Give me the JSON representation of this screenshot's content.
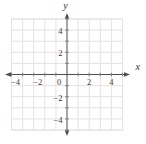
{
  "chart_data": {
    "type": "scatter",
    "title": "",
    "points": [],
    "xlabel": "x",
    "ylabel": "y",
    "xlim": [
      -5,
      5
    ],
    "ylim": [
      -5,
      5
    ],
    "grid": true,
    "grid_spacing_units": 1,
    "tick_label_step": 2,
    "x_ticks": [
      {
        "value": -4,
        "label": "−4"
      },
      {
        "value": -2,
        "label": "−2"
      },
      {
        "value": 2,
        "label": "2"
      },
      {
        "value": 4,
        "label": "4"
      }
    ],
    "y_ticks": [
      {
        "value": 4,
        "label": "4"
      },
      {
        "value": 2,
        "label": "2"
      },
      {
        "value": -2,
        "label": "−2"
      },
      {
        "value": -4,
        "label": "−4"
      }
    ],
    "origin_label": "0",
    "axis_arrows": [
      "left",
      "right",
      "top",
      "bottom"
    ],
    "legend": null
  },
  "colors": {
    "background": "#ffffff",
    "gridline": "#e7e1df",
    "axis": "#4d4d4d",
    "tick_mark": "#858585",
    "tick_label": "#3a3a3a",
    "axis_label": "#333333"
  }
}
